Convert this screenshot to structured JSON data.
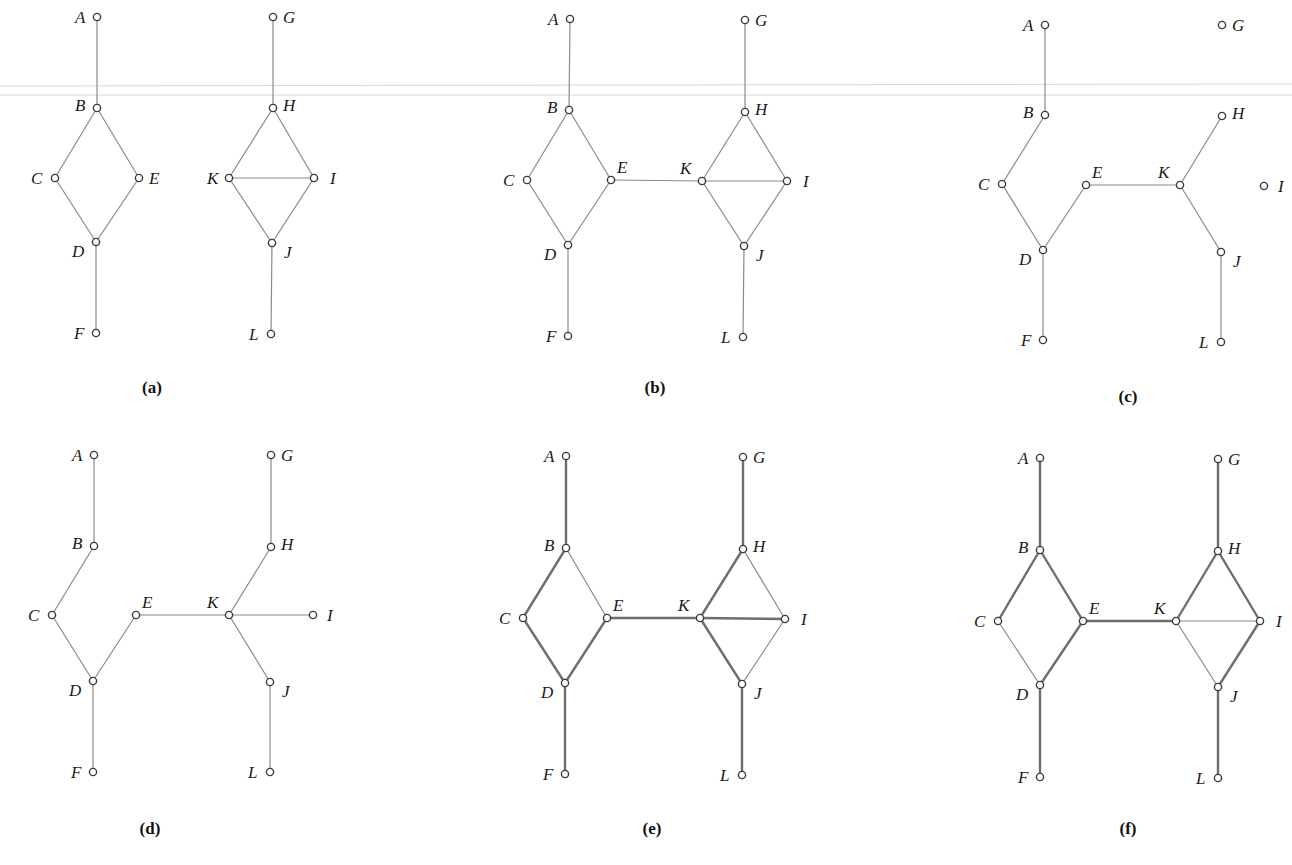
{
  "figure": {
    "colors": {
      "edge": "#8a8a8a",
      "edge_bold": "#6e6e6e",
      "node_stroke": "#3a3a3a",
      "text": "#1a1a1a",
      "background": "#ffffff"
    }
  },
  "panels": [
    {
      "id": "a",
      "caption": "(a)",
      "caption_pos": [
        152,
        393
      ],
      "nodes": {
        "A": {
          "x": 97,
          "y": 17,
          "lx": -22,
          "ly": 6
        },
        "B": {
          "x": 97,
          "y": 108,
          "lx": -22,
          "ly": 3
        },
        "C": {
          "x": 55,
          "y": 178,
          "lx": -24,
          "ly": 6
        },
        "E": {
          "x": 139,
          "y": 178,
          "lx": 10,
          "ly": 6
        },
        "D": {
          "x": 96,
          "y": 242,
          "lx": -24,
          "ly": 15
        },
        "F": {
          "x": 96,
          "y": 333,
          "lx": -22,
          "ly": 6
        },
        "G": {
          "x": 273,
          "y": 17,
          "lx": 10,
          "ly": 6
        },
        "H": {
          "x": 273,
          "y": 108,
          "lx": 10,
          "ly": 3
        },
        "K": {
          "x": 229,
          "y": 178,
          "lx": -22,
          "ly": 6
        },
        "I": {
          "x": 314,
          "y": 178,
          "lx": 16,
          "ly": 6
        },
        "J": {
          "x": 272,
          "y": 243,
          "lx": 12,
          "ly": 15
        },
        "L": {
          "x": 271,
          "y": 334,
          "lx": -22,
          "ly": 6
        }
      },
      "edges": [
        [
          "A",
          "B"
        ],
        [
          "B",
          "C"
        ],
        [
          "B",
          "E"
        ],
        [
          "C",
          "D"
        ],
        [
          "E",
          "D"
        ],
        [
          "D",
          "F"
        ],
        [
          "G",
          "H"
        ],
        [
          "H",
          "K"
        ],
        [
          "H",
          "I"
        ],
        [
          "K",
          "I"
        ],
        [
          "K",
          "J"
        ],
        [
          "I",
          "J"
        ],
        [
          "J",
          "L"
        ]
      ],
      "bold_edges": []
    },
    {
      "id": "b",
      "caption": "(b)",
      "caption_pos": [
        655,
        393
      ],
      "nodes": {
        "A": {
          "x": 570,
          "y": 19,
          "lx": -22,
          "ly": 6
        },
        "B": {
          "x": 569,
          "y": 110,
          "lx": -22,
          "ly": 3
        },
        "C": {
          "x": 527,
          "y": 180,
          "lx": -24,
          "ly": 6
        },
        "E": {
          "x": 611,
          "y": 180,
          "lx": 6,
          "ly": -7
        },
        "D": {
          "x": 568,
          "y": 245,
          "lx": -24,
          "ly": 15
        },
        "F": {
          "x": 568,
          "y": 336,
          "lx": -22,
          "ly": 6
        },
        "G": {
          "x": 745,
          "y": 20,
          "lx": 10,
          "ly": 6
        },
        "H": {
          "x": 745,
          "y": 112,
          "lx": 10,
          "ly": 3
        },
        "K": {
          "x": 702,
          "y": 181,
          "lx": -22,
          "ly": -7
        },
        "I": {
          "x": 787,
          "y": 181,
          "lx": 16,
          "ly": 6
        },
        "J": {
          "x": 744,
          "y": 246,
          "lx": 12,
          "ly": 15
        },
        "L": {
          "x": 743,
          "y": 337,
          "lx": -22,
          "ly": 6
        }
      },
      "edges": [
        [
          "A",
          "B"
        ],
        [
          "B",
          "C"
        ],
        [
          "B",
          "E"
        ],
        [
          "C",
          "D"
        ],
        [
          "E",
          "D"
        ],
        [
          "D",
          "F"
        ],
        [
          "E",
          "K"
        ],
        [
          "G",
          "H"
        ],
        [
          "H",
          "K"
        ],
        [
          "H",
          "I"
        ],
        [
          "K",
          "I"
        ],
        [
          "K",
          "J"
        ],
        [
          "I",
          "J"
        ],
        [
          "J",
          "L"
        ]
      ],
      "bold_edges": []
    },
    {
      "id": "c",
      "caption": "(c)",
      "caption_pos": [
        1128,
        402
      ],
      "nodes": {
        "A": {
          "x": 1045,
          "y": 25,
          "lx": -22,
          "ly": 6
        },
        "B": {
          "x": 1045,
          "y": 115,
          "lx": -22,
          "ly": 3
        },
        "C": {
          "x": 1002,
          "y": 184,
          "lx": -24,
          "ly": 6
        },
        "E": {
          "x": 1086,
          "y": 185,
          "lx": 6,
          "ly": -7
        },
        "D": {
          "x": 1043,
          "y": 250,
          "lx": -24,
          "ly": 15
        },
        "F": {
          "x": 1043,
          "y": 340,
          "lx": -22,
          "ly": 6
        },
        "G": {
          "x": 1222,
          "y": 25,
          "lx": 10,
          "ly": 6
        },
        "H": {
          "x": 1222,
          "y": 116,
          "lx": 10,
          "ly": 3
        },
        "K": {
          "x": 1180,
          "y": 185,
          "lx": -22,
          "ly": -7
        },
        "I": {
          "x": 1264,
          "y": 186,
          "lx": 14,
          "ly": 6
        },
        "J": {
          "x": 1221,
          "y": 252,
          "lx": 12,
          "ly": 15
        },
        "L": {
          "x": 1221,
          "y": 342,
          "lx": -22,
          "ly": 6
        }
      },
      "edges": [
        [
          "A",
          "B"
        ],
        [
          "B",
          "C"
        ],
        [
          "C",
          "D"
        ],
        [
          "E",
          "D"
        ],
        [
          "D",
          "F"
        ],
        [
          "E",
          "K"
        ],
        [
          "H",
          "K"
        ],
        [
          "K",
          "J"
        ],
        [
          "J",
          "L"
        ]
      ],
      "bold_edges": []
    },
    {
      "id": "d",
      "caption": "(d)",
      "caption_pos": [
        150,
        834
      ],
      "nodes": {
        "A": {
          "x": 94,
          "y": 455,
          "lx": -22,
          "ly": 6
        },
        "B": {
          "x": 94,
          "y": 546,
          "lx": -22,
          "ly": 3
        },
        "C": {
          "x": 52,
          "y": 615,
          "lx": -24,
          "ly": 6
        },
        "E": {
          "x": 136,
          "y": 615,
          "lx": 6,
          "ly": -7
        },
        "D": {
          "x": 93,
          "y": 681,
          "lx": -24,
          "ly": 15
        },
        "F": {
          "x": 93,
          "y": 772,
          "lx": -22,
          "ly": 6
        },
        "G": {
          "x": 271,
          "y": 455,
          "lx": 10,
          "ly": 6
        },
        "H": {
          "x": 271,
          "y": 547,
          "lx": 10,
          "ly": 3
        },
        "K": {
          "x": 229,
          "y": 615,
          "lx": -22,
          "ly": -7
        },
        "I": {
          "x": 313,
          "y": 615,
          "lx": 14,
          "ly": 6
        },
        "J": {
          "x": 270,
          "y": 682,
          "lx": 12,
          "ly": 15
        },
        "L": {
          "x": 270,
          "y": 772,
          "lx": -22,
          "ly": 6
        }
      },
      "edges": [
        [
          "A",
          "B"
        ],
        [
          "B",
          "C"
        ],
        [
          "C",
          "D"
        ],
        [
          "E",
          "D"
        ],
        [
          "D",
          "F"
        ],
        [
          "E",
          "K"
        ],
        [
          "G",
          "H"
        ],
        [
          "H",
          "K"
        ],
        [
          "K",
          "I"
        ],
        [
          "K",
          "J"
        ],
        [
          "J",
          "L"
        ]
      ],
      "bold_edges": []
    },
    {
      "id": "e",
      "caption": "(e)",
      "caption_pos": [
        652,
        834
      ],
      "nodes": {
        "A": {
          "x": 566,
          "y": 456,
          "lx": -22,
          "ly": 6
        },
        "B": {
          "x": 566,
          "y": 548,
          "lx": -22,
          "ly": 3
        },
        "C": {
          "x": 523,
          "y": 618,
          "lx": -24,
          "ly": 6
        },
        "E": {
          "x": 607,
          "y": 618,
          "lx": 6,
          "ly": -7
        },
        "D": {
          "x": 565,
          "y": 683,
          "lx": -24,
          "ly": 15
        },
        "F": {
          "x": 565,
          "y": 774,
          "lx": -22,
          "ly": 6
        },
        "G": {
          "x": 743,
          "y": 457,
          "lx": 10,
          "ly": 6
        },
        "H": {
          "x": 743,
          "y": 549,
          "lx": 10,
          "ly": 3
        },
        "K": {
          "x": 700,
          "y": 618,
          "lx": -22,
          "ly": -7
        },
        "I": {
          "x": 785,
          "y": 619,
          "lx": 16,
          "ly": 6
        },
        "J": {
          "x": 742,
          "y": 684,
          "lx": 12,
          "ly": 15
        },
        "L": {
          "x": 742,
          "y": 775,
          "lx": -22,
          "ly": 6
        }
      },
      "edges": [
        [
          "A",
          "B"
        ],
        [
          "B",
          "C"
        ],
        [
          "B",
          "E"
        ],
        [
          "C",
          "D"
        ],
        [
          "E",
          "D"
        ],
        [
          "D",
          "F"
        ],
        [
          "E",
          "K"
        ],
        [
          "G",
          "H"
        ],
        [
          "H",
          "K"
        ],
        [
          "H",
          "I"
        ],
        [
          "K",
          "I"
        ],
        [
          "K",
          "J"
        ],
        [
          "I",
          "J"
        ],
        [
          "J",
          "L"
        ]
      ],
      "bold_edges": [
        [
          "A",
          "B"
        ],
        [
          "B",
          "C"
        ],
        [
          "C",
          "D"
        ],
        [
          "E",
          "D"
        ],
        [
          "D",
          "F"
        ],
        [
          "E",
          "K"
        ],
        [
          "G",
          "H"
        ],
        [
          "H",
          "K"
        ],
        [
          "K",
          "I"
        ],
        [
          "K",
          "J"
        ],
        [
          "J",
          "L"
        ]
      ]
    },
    {
      "id": "f",
      "caption": "(f)",
      "caption_pos": [
        1128,
        834
      ],
      "nodes": {
        "A": {
          "x": 1040,
          "y": 458,
          "lx": -22,
          "ly": 6
        },
        "B": {
          "x": 1040,
          "y": 550,
          "lx": -22,
          "ly": 3
        },
        "C": {
          "x": 998,
          "y": 621,
          "lx": -24,
          "ly": 6
        },
        "E": {
          "x": 1083,
          "y": 621,
          "lx": 6,
          "ly": -7
        },
        "D": {
          "x": 1040,
          "y": 685,
          "lx": -24,
          "ly": 15
        },
        "F": {
          "x": 1040,
          "y": 777,
          "lx": -22,
          "ly": 6
        },
        "G": {
          "x": 1218,
          "y": 459,
          "lx": 10,
          "ly": 6
        },
        "H": {
          "x": 1218,
          "y": 551,
          "lx": 10,
          "ly": 3
        },
        "K": {
          "x": 1176,
          "y": 621,
          "lx": -22,
          "ly": -7
        },
        "I": {
          "x": 1260,
          "y": 621,
          "lx": 16,
          "ly": 6
        },
        "J": {
          "x": 1218,
          "y": 687,
          "lx": 12,
          "ly": 15
        },
        "L": {
          "x": 1218,
          "y": 778,
          "lx": -22,
          "ly": 6
        }
      },
      "edges": [
        [
          "A",
          "B"
        ],
        [
          "B",
          "C"
        ],
        [
          "B",
          "E"
        ],
        [
          "C",
          "D"
        ],
        [
          "E",
          "D"
        ],
        [
          "D",
          "F"
        ],
        [
          "E",
          "K"
        ],
        [
          "G",
          "H"
        ],
        [
          "H",
          "K"
        ],
        [
          "H",
          "I"
        ],
        [
          "K",
          "I"
        ],
        [
          "K",
          "J"
        ],
        [
          "I",
          "J"
        ],
        [
          "J",
          "L"
        ]
      ],
      "bold_edges": [
        [
          "A",
          "B"
        ],
        [
          "B",
          "C"
        ],
        [
          "B",
          "E"
        ],
        [
          "E",
          "D"
        ],
        [
          "D",
          "F"
        ],
        [
          "E",
          "K"
        ],
        [
          "G",
          "H"
        ],
        [
          "H",
          "K"
        ],
        [
          "H",
          "I"
        ],
        [
          "I",
          "J"
        ],
        [
          "J",
          "L"
        ]
      ]
    }
  ],
  "artifacts": {
    "scan_lines_y": [
      86,
      95
    ]
  }
}
